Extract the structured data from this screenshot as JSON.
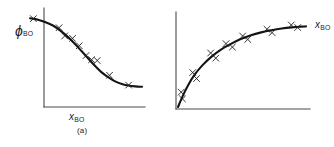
{
  "figure": {
    "background_color": "#ffffff",
    "ink_color": "#141414",
    "axis_color": "#4a4a4a",
    "panels": [
      "a",
      "b"
    ]
  },
  "chart_data": [
    {
      "id": "a",
      "type": "scatter",
      "title": "",
      "caption": "(a)",
      "xlabel": "x",
      "xlabel_sub": "BO",
      "ylabel": "ϕ",
      "ylabel_sub": "BO",
      "xlim": [
        0,
        1
      ],
      "ylim": [
        0,
        1
      ],
      "grid": false,
      "legend": "none",
      "ticks": "none",
      "series": [
        {
          "name": "fitted curve",
          "kind": "line",
          "x": [
            0.0,
            0.05,
            0.1,
            0.16,
            0.22,
            0.28,
            0.34,
            0.4,
            0.46,
            0.52,
            0.58,
            0.64,
            0.7,
            0.76,
            0.82,
            0.88,
            0.94,
            1.0
          ],
          "y": [
            0.96,
            0.95,
            0.93,
            0.9,
            0.86,
            0.8,
            0.73,
            0.65,
            0.56,
            0.47,
            0.38,
            0.3,
            0.24,
            0.19,
            0.16,
            0.14,
            0.13,
            0.125
          ]
        },
        {
          "name": "measured points",
          "kind": "marker",
          "marker": "x",
          "x": [
            0.03,
            0.26,
            0.31,
            0.38,
            0.44,
            0.5,
            0.55,
            0.6,
            0.71,
            0.88
          ],
          "y": [
            0.955,
            0.845,
            0.745,
            0.715,
            0.625,
            0.505,
            0.455,
            0.445,
            0.265,
            0.145
          ]
        }
      ]
    },
    {
      "id": "b",
      "type": "scatter",
      "title": "",
      "caption": "(b)",
      "xlabel": "(L",
      "xlabel_inner_sub": "B",
      "xlabel_tail": ")",
      "xlabel_sub": "BO",
      "ylabel": "x",
      "ylabel_sub": "BO",
      "xlim": [
        0,
        1
      ],
      "ylim": [
        0,
        1
      ],
      "grid": false,
      "legend": "none",
      "ticks": "none",
      "series": [
        {
          "name": "fitted curve",
          "kind": "line",
          "x": [
            0.0,
            0.04,
            0.08,
            0.13,
            0.19,
            0.26,
            0.33,
            0.41,
            0.49,
            0.57,
            0.65,
            0.73,
            0.81,
            0.89,
            0.96,
            1.0
          ],
          "y": [
            0.0,
            0.14,
            0.26,
            0.38,
            0.49,
            0.59,
            0.67,
            0.74,
            0.8,
            0.845,
            0.878,
            0.903,
            0.923,
            0.937,
            0.945,
            0.948
          ]
        },
        {
          "name": "measured points",
          "kind": "marker",
          "marker": "x",
          "x": [
            0.025,
            0.035,
            0.115,
            0.145,
            0.255,
            0.295,
            0.375,
            0.425,
            0.505,
            0.545,
            0.695,
            0.735,
            0.885,
            0.935
          ],
          "y": [
            0.175,
            0.095,
            0.405,
            0.335,
            0.635,
            0.575,
            0.745,
            0.705,
            0.835,
            0.795,
            0.915,
            0.875,
            0.965,
            0.935
          ]
        }
      ]
    }
  ]
}
